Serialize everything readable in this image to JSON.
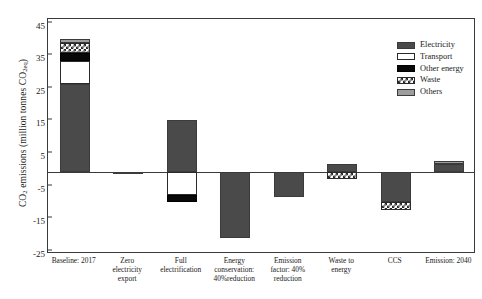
{
  "chart_data": {
    "type": "bar",
    "title": "",
    "subtitle": "",
    "xlabel": "",
    "ylabel": "CO2 emissions (million tonnes CO2eq)",
    "ylabel_parts": {
      "prefix": "CO",
      "sub1": "2",
      "mid": " emissions (million tonnes CO",
      "sub2": "2eq",
      "suffix": ")"
    },
    "ylim": [
      -25,
      47
    ],
    "yticks": [
      45,
      35,
      25,
      15,
      5,
      -5,
      -15,
      -25
    ],
    "ytick_labels": [
      "45",
      "35",
      "25",
      "15",
      "5",
      "-5",
      "-15",
      "-25"
    ],
    "grid": false,
    "legend_position": "top-right",
    "stacked": true,
    "categories": [
      "Baseline: 2017",
      "Zero electricity export",
      "Full electrification",
      "Energy conservation: 40%reduction",
      "Emission factor: 40% reduction",
      "Waste to energy",
      "CCS",
      "Emission: 2040"
    ],
    "series": [
      {
        "name": "Electricity",
        "values": [
          27,
          -0.6,
          16,
          -20,
          -7.5,
          2.5,
          -9,
          2.5
        ]
      },
      {
        "name": "Transport",
        "values": [
          7,
          0,
          -7,
          0,
          0,
          0,
          0,
          0
        ]
      },
      {
        "name": "Other energy",
        "values": [
          2.5,
          0,
          -2,
          0,
          0,
          0,
          0,
          0
        ]
      },
      {
        "name": "Waste",
        "values": [
          3,
          0,
          0,
          0,
          0,
          -2,
          -2.5,
          0
        ]
      },
      {
        "name": "Others",
        "values": [
          1.5,
          0,
          0,
          0,
          0,
          0,
          0,
          1
        ]
      }
    ],
    "bar_totals": [
      41,
      -0.6,
      7,
      -20,
      -7.5,
      0.5,
      -11.5,
      3.5
    ]
  },
  "legend": {
    "items": [
      {
        "label": "Electricity",
        "swatch": "dark-gray-solid",
        "color": "#4a4a4a"
      },
      {
        "label": "Transport",
        "swatch": "white-solid",
        "color": "#ffffff"
      },
      {
        "label": "Other energy",
        "swatch": "black-solid",
        "color": "#080808"
      },
      {
        "label": "Waste",
        "swatch": "cross-hatched",
        "color": "#2a2a2a"
      },
      {
        "label": "Others",
        "swatch": "light-gray-solid",
        "color": "#9d9d9d"
      }
    ]
  },
  "xaxis": {
    "labels": [
      {
        "lines": [
          "Baseline: 2017"
        ]
      },
      {
        "lines": [
          "Zero",
          "electricity",
          "export"
        ]
      },
      {
        "lines": [
          "Full",
          "electrification"
        ]
      },
      {
        "lines": [
          "Energy",
          "conservation:",
          "40%reduction"
        ]
      },
      {
        "lines": [
          "Emission",
          "factor: 40%",
          "reduction"
        ]
      },
      {
        "lines": [
          "Waste to",
          "energy"
        ]
      },
      {
        "lines": [
          "CCS"
        ]
      },
      {
        "lines": [
          "Emission: 2040"
        ]
      }
    ]
  }
}
